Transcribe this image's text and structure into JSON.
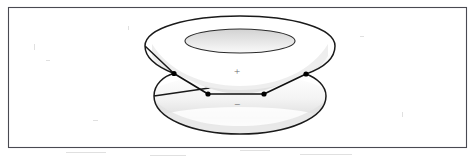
{
  "figure": {
    "frame": {
      "name": "figure-border",
      "x": 8,
      "y": 7,
      "width": 459,
      "height": 141,
      "stroke_color": "#4a4a52",
      "fill_color": "#ffffff"
    },
    "background_color": "#ffffff",
    "outline_color": "#1a1a1a",
    "shade_color": "#d9d9d9",
    "shade_color_light": "#ebebeb",
    "node_color": "#000000",
    "label_color": "#6b6b6b",
    "objects": [
      {
        "name": "upper-torus",
        "label": "+",
        "label_x": 237,
        "label_y": 72,
        "outer_center_x": 240,
        "outer_center_y": 46,
        "outer_rx": 95,
        "outer_ry": 30,
        "inner_center_x": 240,
        "inner_center_y": 41,
        "inner_rx": 55,
        "inner_ry": 12
      },
      {
        "name": "lower-torus",
        "label": "−",
        "label_x": 237,
        "label_y": 105,
        "outer_center_x": 240,
        "outer_center_y": 108,
        "outer_rx": 86,
        "outer_ry": 26
      }
    ],
    "nodes": [
      {
        "name": "node-upper-left",
        "x": 174,
        "y": 73.5,
        "r": 2.4
      },
      {
        "name": "node-lower-left",
        "x": 208,
        "y": 94.0,
        "r": 2.4
      },
      {
        "name": "node-lower-right",
        "x": 264,
        "y": 94.0,
        "r": 2.4
      },
      {
        "name": "node-upper-right",
        "x": 306,
        "y": 74.0,
        "r": 2.4
      }
    ],
    "edges": [
      {
        "name": "edge-upper-left-to-lower-left",
        "from": "node-upper-left",
        "to": "node-lower-left"
      },
      {
        "name": "edge-lower-left-to-lower-right",
        "from": "node-lower-left",
        "to": "node-lower-right"
      },
      {
        "name": "edge-lower-right-to-upper-right",
        "from": "node-lower-right",
        "to": "node-upper-right"
      }
    ]
  }
}
